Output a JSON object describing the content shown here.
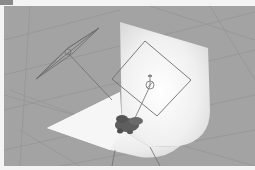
{
  "window": {
    "tab_color": "#8a8a8a",
    "frame_color": "#f4f4f4"
  },
  "viewport": {
    "type": "3d-viewport",
    "background_color": "#a3a3a3",
    "grid_color": "#959595",
    "objects": [
      {
        "name": "cyclorama-backdrop",
        "color": "#f4f4f4"
      },
      {
        "name": "area-light-left",
        "shape": "parallelogram"
      },
      {
        "name": "area-light-right",
        "shape": "square"
      },
      {
        "name": "subject-model",
        "color": "#5a5a5a"
      }
    ]
  }
}
